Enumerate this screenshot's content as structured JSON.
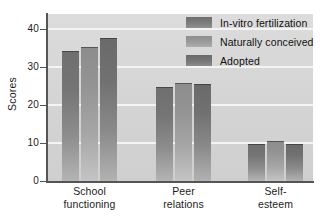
{
  "chart_data": {
    "type": "bar",
    "title": "",
    "subtitle": "",
    "xlabel": "",
    "ylabel": "Scores",
    "ylim": [
      0,
      44
    ],
    "yticks": [
      0,
      10,
      20,
      30,
      40
    ],
    "ytick_labels": [
      "0",
      "10",
      "20",
      "30",
      "40"
    ],
    "grid": "horizontal-white-gridlines",
    "legend_position": "top-right-inside",
    "categories": [
      "School functioning",
      "Peer relations",
      "Self-esteem"
    ],
    "category_lines": [
      [
        "School",
        "functioning"
      ],
      [
        "Peer",
        "relations"
      ],
      [
        "Self-",
        "esteem"
      ]
    ],
    "series": [
      {
        "name": "In-vitro fertilization",
        "color": "#777777",
        "values": [
          34.2,
          24.9,
          9.7
        ]
      },
      {
        "name": "Naturally conceived",
        "color": "#9b9b9b",
        "values": [
          35.3,
          25.7,
          10.5
        ]
      },
      {
        "name": "Adopted",
        "color": "#6e6e6e",
        "values": [
          37.8,
          25.5,
          9.7
        ]
      }
    ],
    "annotations": []
  },
  "legend": {
    "items": [
      {
        "label": "In-vitro fertilization"
      },
      {
        "label": "Naturally conceived"
      },
      {
        "label": "Adopted"
      }
    ]
  },
  "axis": {
    "y_title": "Scores"
  },
  "colors": {
    "plot_background": "#d6d6d6",
    "page_background": "#ffffff",
    "gridline": "#f4f4f4",
    "axis_line": "#555555",
    "text": "#1c1c1c"
  }
}
